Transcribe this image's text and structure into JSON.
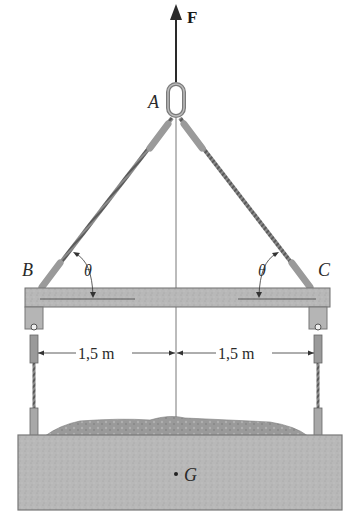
{
  "diagram": {
    "type": "statics-lifting-beam",
    "labels": {
      "force": "F",
      "point_a": "A",
      "point_b": "B",
      "point_c": "C",
      "angle_left": "θ",
      "angle_right": "θ",
      "center_of_gravity": "G",
      "dim_left": "1,5 m",
      "dim_right": "1,5 m"
    },
    "colors": {
      "beam": "#bdbdbd",
      "container": "#b5b5b5",
      "load": "#9a9a9a",
      "cable": "#707070",
      "line": "#3a3a3a"
    }
  }
}
